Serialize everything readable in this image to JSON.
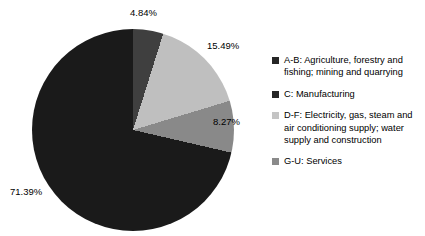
{
  "chart_data": {
    "type": "pie",
    "title": "",
    "legend_position": "right",
    "categories": [
      "A-B: Agriculture, forestry and fishing; mining and quarrying",
      "C: Manufacturing",
      "D-F: Electricity, gas, steam and air conditioning supply; water supply and construction",
      "G-U: Services"
    ],
    "values": [
      4.84,
      15.49,
      8.27,
      71.39
    ],
    "value_labels": [
      "4.84%",
      "15.49%",
      "8.27%",
      "71.39%"
    ],
    "units": "percent",
    "colors": [
      "#3f3f3f",
      "#bfbfbf",
      "#898989",
      "#1a1a1a"
    ],
    "start_angle_deg": 0,
    "direction": "clockwise"
  },
  "pie": {
    "slices": [
      {
        "key": "ab",
        "name": "A-B: Agriculture, forestry and fishing; mining and quarrying",
        "pct_label": "4.84%",
        "value": 4.84,
        "color": "#3f3f3f"
      },
      {
        "key": "c",
        "name": "C: Manufacturing",
        "pct_label": "15.49%",
        "value": 15.49,
        "color": "#bfbfbf"
      },
      {
        "key": "df",
        "name": "D-F: Electricity, gas, steam and air conditioning supply; water supply and construction",
        "pct_label": "8.27%",
        "value": 8.27,
        "color": "#898989"
      },
      {
        "key": "gu",
        "name": "G-U: Services",
        "pct_label": "71.39%",
        "value": 71.39,
        "color": "#1a1a1a"
      }
    ]
  },
  "legend": {
    "items": [
      {
        "label": "A-B: Agriculture, forestry and fishing; mining and quarrying",
        "color": "#262626"
      },
      {
        "label": "C: Manufacturing",
        "color": "#262626"
      },
      {
        "label": "D-F: Electricity, gas, steam and air conditioning supply; water supply and construction",
        "color": "#c4c4c4"
      },
      {
        "label": "G-U: Services",
        "color": "#8a8a8a"
      }
    ]
  }
}
